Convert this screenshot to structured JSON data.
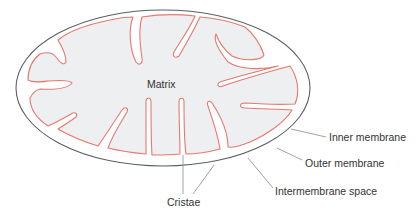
{
  "colors": {
    "outer_membrane": "#5a5f63",
    "inner_membrane": "#e8776f",
    "matrix_fill": "#eeeff1",
    "intermembrane_fill": "#ffffff",
    "label_text": "#333333",
    "leader_line": "#8a8a8a"
  },
  "labels": {
    "matrix": "Matrix",
    "inner_membrane": "Inner membrane",
    "outer_membrane": "Outer membrane",
    "intermembrane_space": "Intermembrane space",
    "cristae": "Cristae"
  }
}
